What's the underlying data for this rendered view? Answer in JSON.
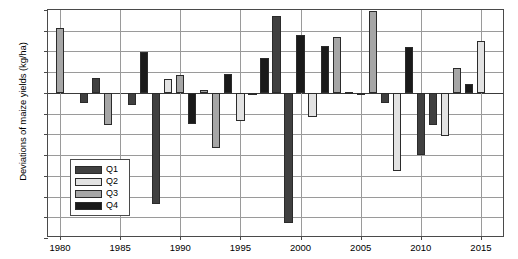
{
  "chart_data": {
    "type": "bar",
    "title": "",
    "xlabel": "",
    "ylabel": "Deviations of maize yields (kg/ha)",
    "xlim": [
      1979,
      2017
    ],
    "ylim": [
      -3500,
      2000
    ],
    "ytick_labels": [
      "2000",
      "1500",
      "1000",
      "500",
      "0",
      "-500",
      "-1000",
      "-1500",
      "-2000",
      "-2500",
      "-3000",
      "-3500"
    ],
    "ytick_values": [
      2000,
      1500,
      1000,
      500,
      0,
      -500,
      -1000,
      -1500,
      -2000,
      -2500,
      -3000,
      -3500
    ],
    "xtick_labels": [
      "1980",
      "1985",
      "1990",
      "1995",
      "2000",
      "2005",
      "2010",
      "2015"
    ],
    "xtick_values": [
      1980,
      1985,
      1990,
      1995,
      2000,
      2005,
      2010,
      2015
    ],
    "grid": true,
    "legend_position": "lower-left",
    "legend": [
      {
        "name": "Q1",
        "color": "#404040"
      },
      {
        "name": "Q2",
        "color": "#e2e2e2"
      },
      {
        "name": "Q3",
        "color": "#a6a6a6"
      },
      {
        "name": "Q4",
        "color": "#1a1a1a"
      }
    ],
    "x": [
      1980,
      1982,
      1983,
      1984,
      1986,
      1987,
      1988,
      1989,
      1990,
      1991,
      1992,
      1993,
      1994,
      1995,
      1996,
      1997,
      1998,
      1999,
      2000,
      2001,
      2002,
      2003,
      2004,
      2005,
      2006,
      2007,
      2008,
      2009,
      2010,
      2011,
      2012,
      2013,
      2014,
      2015
    ],
    "values": [
      1570,
      -250,
      370,
      -780,
      -280,
      980,
      -2670,
      330,
      420,
      -750,
      70,
      -1320,
      460,
      -680,
      -50,
      850,
      1850,
      -3150,
      1400,
      -570,
      1130,
      1340,
      30,
      -60,
      1980,
      -250,
      -1880,
      1110,
      -1490,
      -780,
      -1050,
      600,
      210,
      1260
    ],
    "series_group": [
      "Q3",
      "Q1",
      "Q1",
      "Q3",
      "Q1",
      "Q4",
      "Q1",
      "Q2",
      "Q3",
      "Q4",
      "Q3",
      "Q3",
      "Q4",
      "Q2",
      "Q2",
      "Q4",
      "Q1",
      "Q1",
      "Q4",
      "Q2",
      "Q4",
      "Q3",
      "Q3",
      "Q2",
      "Q3",
      "Q1",
      "Q2",
      "Q4",
      "Q1",
      "Q1",
      "Q2",
      "Q3",
      "Q4",
      "Q2"
    ],
    "points": [
      {
        "year": 1980,
        "value": 1570,
        "quarter": "Q3"
      },
      {
        "year": 1982,
        "value": -250,
        "quarter": "Q1"
      },
      {
        "year": 1983,
        "value": 370,
        "quarter": "Q1"
      },
      {
        "year": 1984,
        "value": -780,
        "quarter": "Q3"
      },
      {
        "year": 1986,
        "value": -280,
        "quarter": "Q1"
      },
      {
        "year": 1987,
        "value": 980,
        "quarter": "Q4"
      },
      {
        "year": 1988,
        "value": -2670,
        "quarter": "Q1"
      },
      {
        "year": 1989,
        "value": 330,
        "quarter": "Q2"
      },
      {
        "year": 1990,
        "value": 420,
        "quarter": "Q3"
      },
      {
        "year": 1991,
        "value": -750,
        "quarter": "Q4"
      },
      {
        "year": 1992,
        "value": 70,
        "quarter": "Q3"
      },
      {
        "year": 1993,
        "value": -1320,
        "quarter": "Q3"
      },
      {
        "year": 1994,
        "value": 460,
        "quarter": "Q4"
      },
      {
        "year": 1995,
        "value": -680,
        "quarter": "Q2"
      },
      {
        "year": 1996,
        "value": -50,
        "quarter": "Q2"
      },
      {
        "year": 1997,
        "value": 850,
        "quarter": "Q4"
      },
      {
        "year": 1998,
        "value": 1850,
        "quarter": "Q1"
      },
      {
        "year": 1999,
        "value": -3150,
        "quarter": "Q1"
      },
      {
        "year": 2000,
        "value": 1400,
        "quarter": "Q4"
      },
      {
        "year": 2001,
        "value": -570,
        "quarter": "Q2"
      },
      {
        "year": 2002,
        "value": 1130,
        "quarter": "Q4"
      },
      {
        "year": 2003,
        "value": 1340,
        "quarter": "Q3"
      },
      {
        "year": 2004,
        "value": 30,
        "quarter": "Q3"
      },
      {
        "year": 2005,
        "value": -60,
        "quarter": "Q2"
      },
      {
        "year": 2006,
        "value": 1980,
        "quarter": "Q3"
      },
      {
        "year": 2007,
        "value": -250,
        "quarter": "Q1"
      },
      {
        "year": 2008,
        "value": -1880,
        "quarter": "Q2"
      },
      {
        "year": 2009,
        "value": 1110,
        "quarter": "Q4"
      },
      {
        "year": 2010,
        "value": -1490,
        "quarter": "Q1"
      },
      {
        "year": 2011,
        "value": -780,
        "quarter": "Q1"
      },
      {
        "year": 2012,
        "value": -1050,
        "quarter": "Q2"
      },
      {
        "year": 2013,
        "value": 600,
        "quarter": "Q3"
      },
      {
        "year": 2014,
        "value": 210,
        "quarter": "Q4"
      },
      {
        "year": 2015,
        "value": 1260,
        "quarter": "Q2"
      }
    ]
  }
}
